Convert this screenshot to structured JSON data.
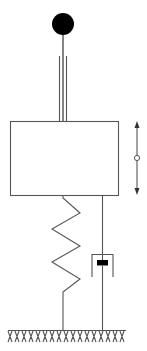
{
  "diagram": {
    "type": "mechanical-schematic",
    "title": "",
    "components": [
      {
        "id": "ball",
        "kind": "mass-ball",
        "label": ""
      },
      {
        "id": "stem",
        "kind": "rod-with-guides",
        "label": ""
      },
      {
        "id": "mass-block",
        "kind": "rigid-body-box",
        "label": ""
      },
      {
        "id": "motion-arrow",
        "kind": "double-headed-arrow",
        "label": ""
      },
      {
        "id": "spring",
        "kind": "spring",
        "label": ""
      },
      {
        "id": "damper",
        "kind": "dashpot",
        "label": ""
      },
      {
        "id": "ground",
        "kind": "fixed-ground-hatched",
        "label": ""
      }
    ],
    "connections": [
      {
        "from": "ball",
        "to": "mass-block",
        "via": "stem"
      },
      {
        "from": "mass-block",
        "to": "ground",
        "via": "spring"
      },
      {
        "from": "mass-block",
        "to": "ground",
        "via": "damper"
      }
    ],
    "colors": {
      "line": "#555555",
      "fill_dark": "#000000",
      "background": "#ffffff"
    }
  }
}
